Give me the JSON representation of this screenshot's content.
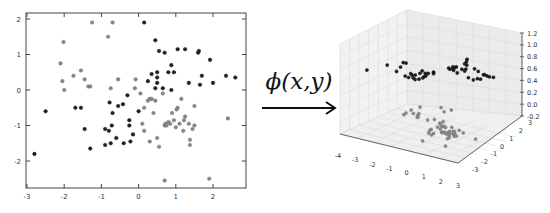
{
  "left_chart": {
    "type": "scatter",
    "xticks": [
      "-3",
      "-2",
      "-1",
      "0",
      "1",
      "2"
    ],
    "yticks": [
      "2",
      "1",
      "0",
      "-1",
      "-2"
    ],
    "xlim": [
      -3.0,
      2.8
    ],
    "ylim": [
      -2.7,
      2.2
    ]
  },
  "mapping": {
    "label": "ϕ(x,y)",
    "arrow": "right-arrow"
  },
  "right_chart": {
    "type": "scatter3d",
    "z_ticks": [
      "1.2",
      "1.0",
      "0.8",
      "0.6",
      "0.4",
      "0.2",
      "0.0",
      "-0.2"
    ],
    "x_ticks": [
      "-4",
      "-3",
      "-2",
      "-1",
      "0",
      "1",
      "2",
      "3"
    ],
    "y_ticks": [
      "-3",
      "-2",
      "-1",
      "0",
      "1",
      "2",
      "3"
    ]
  },
  "chart_data": [
    {
      "type": "scatter",
      "title": "",
      "xlabel": "",
      "ylabel": "",
      "xlim": [
        -3.0,
        2.8
      ],
      "ylim": [
        -2.7,
        2.2
      ],
      "grid": false,
      "series": [
        {
          "name": "class-dark (outer)",
          "color": "#222222",
          "points": [
            [
              -2.8,
              -1.8
            ],
            [
              -2.5,
              -0.6
            ],
            [
              -1.7,
              -0.5
            ],
            [
              -1.55,
              -0.5
            ],
            [
              -1.45,
              -1.1
            ],
            [
              -1.3,
              -1.65
            ],
            [
              -0.9,
              -1.55
            ],
            [
              -0.9,
              -1.1
            ],
            [
              -0.8,
              -1.15
            ],
            [
              -0.75,
              -1.5
            ],
            [
              -0.72,
              -1.0
            ],
            [
              -0.7,
              -0.65
            ],
            [
              -0.78,
              -0.35
            ],
            [
              -0.6,
              -1.35
            ],
            [
              -0.55,
              -0.45
            ],
            [
              -0.42,
              -0.4
            ],
            [
              -0.4,
              -1.5
            ],
            [
              -0.3,
              -0.15
            ],
            [
              -0.25,
              -0.85
            ],
            [
              -0.25,
              -1.0
            ],
            [
              -0.22,
              -1.45
            ],
            [
              -0.15,
              -1.25
            ],
            [
              0.0,
              -0.6
            ],
            [
              0.15,
              1.9
            ],
            [
              0.25,
              0.25
            ],
            [
              0.35,
              0.45
            ],
            [
              0.45,
              0.05
            ],
            [
              0.45,
              1.4
            ],
            [
              0.5,
              0.5
            ],
            [
              0.5,
              0.35
            ],
            [
              0.5,
              0.2
            ],
            [
              0.55,
              1.1
            ],
            [
              0.65,
              0.05
            ],
            [
              0.7,
              1.05
            ],
            [
              0.8,
              0.5
            ],
            [
              0.88,
              0.7
            ],
            [
              0.88,
              0.0
            ],
            [
              0.95,
              0.5
            ],
            [
              1.05,
              1.15
            ],
            [
              1.25,
              1.15
            ],
            [
              1.35,
              0.2
            ],
            [
              1.6,
              1.05
            ],
            [
              1.62,
              1.1
            ],
            [
              1.65,
              0.15
            ],
            [
              1.7,
              0.4
            ],
            [
              1.92,
              0.85
            ],
            [
              2.0,
              0.2
            ],
            [
              2.35,
              0.4
            ],
            [
              2.6,
              0.35
            ]
          ]
        },
        {
          "name": "class-light (inner)",
          "color": "#8a8a8a",
          "points": [
            [
              -2.1,
              0.75
            ],
            [
              -2.05,
              0.25
            ],
            [
              -2.02,
              1.35
            ],
            [
              -2.0,
              0.0
            ],
            [
              -1.75,
              0.4
            ],
            [
              -1.55,
              0.55
            ],
            [
              -1.45,
              0.3
            ],
            [
              -1.35,
              0.1
            ],
            [
              -1.3,
              0.1
            ],
            [
              -1.25,
              1.9
            ],
            [
              -0.82,
              1.5
            ],
            [
              -0.75,
              0.05
            ],
            [
              -0.7,
              1.9
            ],
            [
              -0.55,
              0.3
            ],
            [
              -0.1,
              0.05
            ],
            [
              -0.08,
              0.3
            ],
            [
              0.05,
              -0.1
            ],
            [
              0.1,
              -0.95
            ],
            [
              0.15,
              -1.15
            ],
            [
              0.15,
              -0.5
            ],
            [
              0.25,
              -0.3
            ],
            [
              0.3,
              -0.25
            ],
            [
              0.3,
              -1.45
            ],
            [
              0.35,
              -0.25
            ],
            [
              0.4,
              -0.65
            ],
            [
              0.45,
              -0.3
            ],
            [
              0.5,
              -1.35
            ],
            [
              0.55,
              -1.6
            ],
            [
              0.65,
              -0.1
            ],
            [
              0.7,
              -1.0
            ],
            [
              0.72,
              -0.95
            ],
            [
              0.75,
              -1.0
            ],
            [
              0.8,
              -0.9
            ],
            [
              0.85,
              -0.95
            ],
            [
              0.9,
              -0.65
            ],
            [
              0.95,
              -0.85
            ],
            [
              1.0,
              -1.05
            ],
            [
              1.02,
              -0.55
            ],
            [
              1.05,
              -0.5
            ],
            [
              1.1,
              -0.95
            ],
            [
              1.15,
              -0.25
            ],
            [
              1.2,
              -1.15
            ],
            [
              1.22,
              -0.85
            ],
            [
              1.25,
              -0.75
            ],
            [
              1.35,
              -0.95
            ],
            [
              1.38,
              -1.4
            ],
            [
              1.38,
              -1.55
            ],
            [
              1.45,
              -1.1
            ],
            [
              1.5,
              -0.45
            ],
            [
              1.5,
              -1.0
            ],
            [
              0.7,
              -2.55
            ],
            [
              1.9,
              -2.5
            ],
            [
              2.4,
              -0.8
            ]
          ]
        }
      ]
    },
    {
      "type": "scatter3d",
      "title": "",
      "axes": {
        "x": [
          -4,
          3
        ],
        "y": [
          -3,
          3
        ],
        "z": [
          -0.2,
          1.2
        ]
      },
      "grid": true,
      "series": [
        {
          "name": "class-dark (z≈1)",
          "color": "#222222",
          "z_level": 0.9
        },
        {
          "name": "class-light (z≈0)",
          "color": "#8a8a8a",
          "z_level": 0.0
        }
      ]
    }
  ]
}
